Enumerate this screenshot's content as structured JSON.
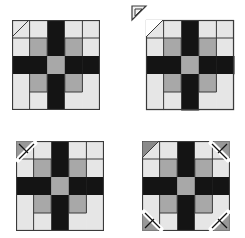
{
  "diagram": {
    "colors": {
      "light": "#e6e6e6",
      "gray": "#a8a8a8",
      "dark": "#141414",
      "seam": "#3a3a3a",
      "corner_dark": "#8a8a8a",
      "marker": "#ffffff"
    },
    "grid": {
      "rows": 5,
      "cols": 5,
      "cells": [
        [
          "light",
          "light",
          "dark",
          "light",
          "light"
        ],
        [
          "light",
          "gray",
          "dark",
          "gray",
          "light"
        ],
        [
          "dark",
          "dark",
          "gray",
          "dark",
          "dark"
        ],
        [
          "light",
          "gray",
          "dark",
          "gray",
          "light"
        ],
        [
          "light",
          "light",
          "dark",
          "light",
          "light"
        ]
      ]
    },
    "blocks": [
      {
        "id": "block-1",
        "step": "diagonal line marked on top-left corner",
        "x": 12,
        "y": 20,
        "corners_marked": [
          "top-left"
        ],
        "corners_cut": [],
        "markers": []
      },
      {
        "id": "block-2",
        "step": "top-left corner triangle cut off and set aside",
        "x": 146,
        "y": 20,
        "corners_marked": [],
        "corners_cut": [
          "top-left"
        ],
        "markers": []
      },
      {
        "id": "block-3",
        "step": "corner square placed at top-left with sewing line",
        "x": 16,
        "y": 141,
        "corners_marked": [],
        "corners_cut": [],
        "markers": [
          "top-left"
        ]
      },
      {
        "id": "block-4",
        "step": "top-left corner sewn; remaining three corners with square markers",
        "x": 142,
        "y": 141,
        "corners_marked": [],
        "corners_cut": [],
        "corners_sewn": [
          "top-left"
        ],
        "markers": [
          "top-right",
          "bottom-left",
          "bottom-right"
        ]
      }
    ]
  }
}
